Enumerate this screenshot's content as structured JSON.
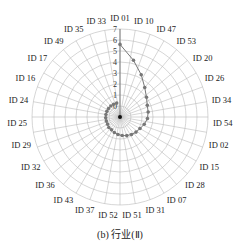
{
  "caption": "(b) 行业(Ⅱ)",
  "chart_data": {
    "type": "radar",
    "title": "",
    "caption": "(b) 行业(Ⅱ)",
    "radial_ticks": [
      "0",
      "1",
      "2",
      "3",
      "4",
      "5",
      "6",
      "7"
    ],
    "rlim": [
      -1,
      7
    ],
    "grid": true,
    "categories": [
      "ID 01",
      "ID 10",
      "ID 47",
      "ID 53",
      "ID 20",
      "ID 26",
      "ID 34",
      "ID 54",
      "ID 02",
      "ID 15",
      "ID 28",
      "ID 07",
      "ID 31",
      "ID 51",
      "ID 52",
      "ID 37",
      "ID 43",
      "ID 36",
      "ID 32",
      "ID 29",
      "ID 25",
      "ID 24",
      "ID 16",
      "ID 17",
      "ID 49",
      "ID 35",
      "ID 33"
    ],
    "series": [
      {
        "name": "行业(Ⅱ)",
        "color": "#777777",
        "values": [
          5.6,
          4.3,
          3.3,
          2.5,
          2.0,
          1.7,
          1.6,
          1.5,
          1.3,
          1.1,
          1.0,
          0.9,
          0.8,
          0.7,
          0.6,
          0.5,
          0.4,
          0.4,
          0.3,
          0.3,
          0.3,
          0.3,
          0.3,
          0.3,
          0.3,
          0.3,
          0.3
        ]
      }
    ]
  }
}
